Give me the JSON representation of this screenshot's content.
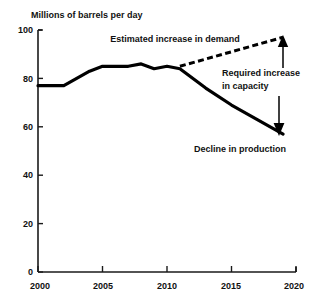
{
  "chart_data": {
    "type": "line",
    "title": "Millions of barrels per day",
    "xlabel": "",
    "ylabel": "Millions of barrels per day",
    "xlim": [
      2000,
      2020
    ],
    "ylim": [
      0,
      100
    ],
    "grid": false,
    "legend": "none",
    "x_ticks": [
      "2000",
      "2005",
      "2010",
      "2015",
      "2020"
    ],
    "x_tick_values": [
      2000,
      2005,
      2010,
      2015,
      2020
    ],
    "y_ticks": [
      "0",
      "20",
      "40",
      "60",
      "80",
      "100"
    ],
    "y_tick_values": [
      0,
      20,
      40,
      60,
      80,
      100
    ],
    "series": [
      {
        "name": "Historical and declining production",
        "style": "solid",
        "x": [
          2000,
          2002,
          2003,
          2004,
          2005,
          2006,
          2007,
          2008,
          2009,
          2010,
          2011,
          2013,
          2015,
          2017,
          2019
        ],
        "values": [
          77,
          77,
          80,
          83,
          85,
          85,
          85,
          86,
          84,
          85,
          84,
          76,
          69,
          63,
          57
        ]
      },
      {
        "name": "Estimated increase in demand",
        "style": "dashed",
        "x": [
          2011,
          2013,
          2015,
          2017,
          2019
        ],
        "values": [
          85,
          88,
          91,
          94,
          97
        ]
      }
    ],
    "annotations": [
      {
        "name": "estimated-increase-in-demand",
        "text": "Estimated increase in demand",
        "x": 2013.2,
        "y": 98.5,
        "arrow": false
      },
      {
        "name": "required-increase-in-capacity",
        "text_lines": [
          "Required increase",
          "in capacity"
        ],
        "x": 2016.4,
        "y": 85,
        "arrow": true,
        "arrow_direction": "up"
      },
      {
        "name": "decline-in-production",
        "text": "Decline in production",
        "x": 2016.0,
        "y": 51,
        "arrow": true,
        "arrow_direction": "down"
      }
    ],
    "colors": {
      "line": "#000000",
      "axis": "#1a1a1a",
      "background": "#ffffff"
    }
  }
}
